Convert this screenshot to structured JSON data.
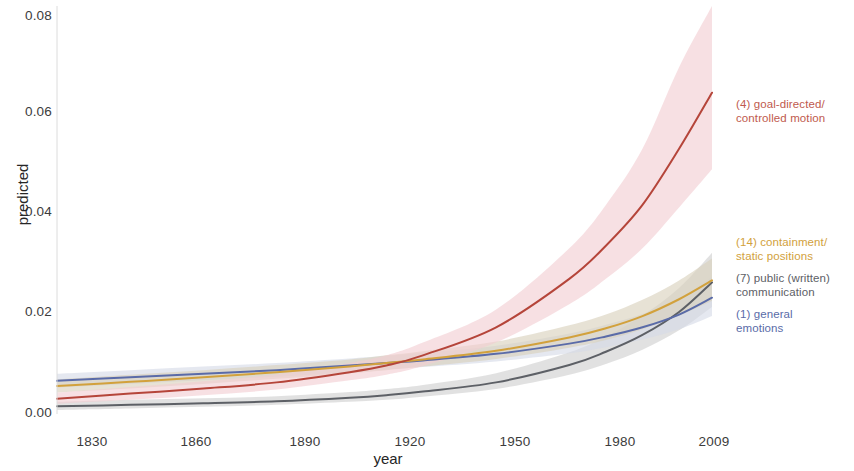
{
  "chart_data": {
    "type": "line",
    "title": "",
    "subtitle": "",
    "xlabel": "year",
    "ylabel": "predicted",
    "xlim": [
      1830,
      2009
    ],
    "ylim": [
      0.0,
      0.08
    ],
    "xticks": [
      "1830",
      "1860",
      "1890",
      "1920",
      "1950",
      "1980",
      "2009"
    ],
    "xtick_values": [
      1830,
      1860,
      1890,
      1920,
      1950,
      1980,
      2009
    ],
    "yticks": [
      "0.00",
      "0.02",
      "0.04",
      "0.06",
      "0.08"
    ],
    "ytick_values": [
      0.0,
      0.02,
      0.04,
      0.06,
      0.08
    ],
    "grid": false,
    "legend_position": "right",
    "bands": "95% confidence ribbons shaded around each line",
    "x": [
      1830,
      1850,
      1870,
      1890,
      1910,
      1920,
      1930,
      1950,
      1970,
      1980,
      1990,
      2000,
      2009
    ],
    "series": [
      {
        "name": "(4) goal-directed/\ncontrolled motion",
        "key": "goal_directed_controlled_motion",
        "index": 4,
        "color": "#b5453a",
        "band_color": "#f2cdd2",
        "values": [
          0.003,
          0.004,
          0.005,
          0.0062,
          0.0082,
          0.0095,
          0.0115,
          0.017,
          0.0265,
          0.033,
          0.041,
          0.052,
          0.063
        ],
        "lower": [
          0.002,
          0.0028,
          0.0037,
          0.0048,
          0.0066,
          0.0077,
          0.0094,
          0.014,
          0.0215,
          0.0265,
          0.0325,
          0.0405,
          0.048
        ],
        "upper": [
          0.0042,
          0.0053,
          0.0064,
          0.0078,
          0.01,
          0.0115,
          0.014,
          0.0205,
          0.0325,
          0.041,
          0.052,
          0.068,
          0.086
        ]
      },
      {
        "name": "(14) containment/\nstatic positions",
        "key": "containment_static_positions",
        "index": 14,
        "color": "#d2a13c",
        "band_color": "#d9d0bb",
        "values": [
          0.0055,
          0.0063,
          0.0072,
          0.0082,
          0.0093,
          0.01,
          0.0107,
          0.0124,
          0.015,
          0.0168,
          0.0192,
          0.0225,
          0.0262
        ],
        "lower": [
          0.0042,
          0.005,
          0.0059,
          0.0069,
          0.008,
          0.0086,
          0.0093,
          0.0108,
          0.013,
          0.0145,
          0.0166,
          0.0193,
          0.0222
        ],
        "upper": [
          0.0068,
          0.0077,
          0.0086,
          0.0096,
          0.0107,
          0.0115,
          0.0123,
          0.0142,
          0.0174,
          0.0195,
          0.0224,
          0.0262,
          0.0305
        ]
      },
      {
        "name": "(7) public (written)\ncommunication",
        "key": "public_written_communication",
        "index": 7,
        "color": "#5d6066",
        "band_color": "#cfcfcf",
        "values": [
          0.0015,
          0.0018,
          0.0021,
          0.0025,
          0.0032,
          0.0037,
          0.0044,
          0.0062,
          0.0096,
          0.0122,
          0.0155,
          0.02,
          0.0258
        ],
        "lower": [
          0.0008,
          0.0011,
          0.0014,
          0.0018,
          0.0024,
          0.0028,
          0.0034,
          0.0049,
          0.0077,
          0.0098,
          0.0126,
          0.0164,
          0.021
        ],
        "upper": [
          0.0024,
          0.0028,
          0.0031,
          0.0035,
          0.0043,
          0.0049,
          0.0057,
          0.008,
          0.0121,
          0.0152,
          0.0193,
          0.0247,
          0.0316
        ]
      },
      {
        "name": "(1) general\n emotions",
        "key": "general_emotions",
        "index": 1,
        "color": "#5a6ba8",
        "band_color": "#d5dae6",
        "values": [
          0.0065,
          0.0072,
          0.0079,
          0.0086,
          0.0095,
          0.01,
          0.0105,
          0.0118,
          0.0138,
          0.0152,
          0.017,
          0.0195,
          0.0228
        ],
        "lower": [
          0.0052,
          0.0059,
          0.0066,
          0.0073,
          0.0082,
          0.0087,
          0.0092,
          0.0103,
          0.0119,
          0.0131,
          0.0146,
          0.0166,
          0.0192
        ],
        "upper": [
          0.0079,
          0.0086,
          0.0093,
          0.01,
          0.0109,
          0.0114,
          0.012,
          0.0134,
          0.0158,
          0.0175,
          0.0196,
          0.0226,
          0.0268
        ]
      }
    ]
  },
  "axes": {
    "ylabel": "predicted",
    "xlabel": "year",
    "yticks": [
      "0.08",
      "0.06",
      "0.04",
      "0.02",
      "0.00"
    ],
    "xticks": [
      "1830",
      "1860",
      "1890",
      "1920",
      "1950",
      "1980",
      "2009"
    ]
  },
  "legend": {
    "entries": [
      {
        "label": "(4) goal-directed/\ncontrolled motion",
        "color": "#c05a4e"
      },
      {
        "label": "(14) containment/\nstatic positions",
        "color": "#d2a13c"
      },
      {
        "label": "(7) public (written)\ncommunication",
        "color": "#5d6066"
      },
      {
        "label": "(1) general\n emotions",
        "color": "#5a6ba8"
      }
    ]
  }
}
